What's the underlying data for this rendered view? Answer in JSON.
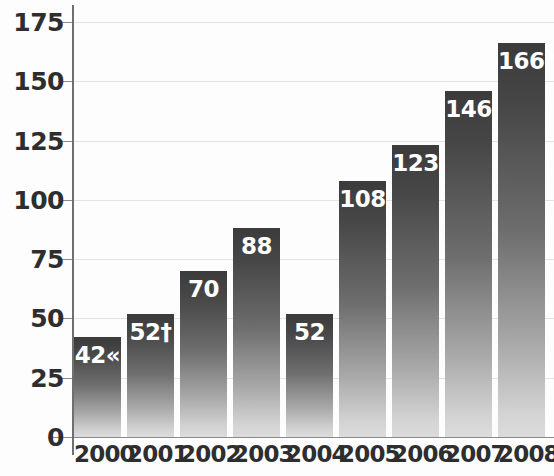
{
  "chart_data": {
    "type": "bar",
    "title": "",
    "subtitle": "",
    "xlabel": "",
    "ylabel": "",
    "categories": [
      "2000",
      "2001",
      "2002",
      "2003",
      "2004",
      "2005",
      "2006",
      "2007",
      "2008"
    ],
    "values": [
      42,
      52,
      70,
      88,
      52,
      108,
      123,
      146,
      166
    ],
    "data_labels": [
      "42«",
      "52†",
      "70",
      "88",
      "52",
      "108",
      "123",
      "146",
      "166*"
    ],
    "series": [
      {
        "name": "",
        "values": [
          42,
          52,
          70,
          88,
          52,
          108,
          123,
          146,
          166
        ]
      }
    ],
    "ylim": [
      0,
      175
    ],
    "ytick_labels": [
      "0",
      "25",
      "50",
      "75",
      "100",
      "125",
      "150",
      "175"
    ],
    "ytick_values": [
      0,
      25,
      50,
      75,
      100,
      125,
      150,
      175
    ],
    "grid": true,
    "legend": false,
    "legend_position": "none",
    "annotations": [
      {
        "category": "2000",
        "symbol": "«"
      },
      {
        "category": "2001",
        "symbol": "†"
      },
      {
        "category": "2008",
        "symbol": "*"
      }
    ],
    "colors": {
      "bar_top": "#3b3b3b",
      "bar_bottom": "#dcdcdc",
      "axis": "#6f6f6f",
      "grid": "#e3e3e3",
      "tick_text": "#2e2e2e",
      "value_text": "#ffffff",
      "background": "#fdfdfd"
    }
  }
}
